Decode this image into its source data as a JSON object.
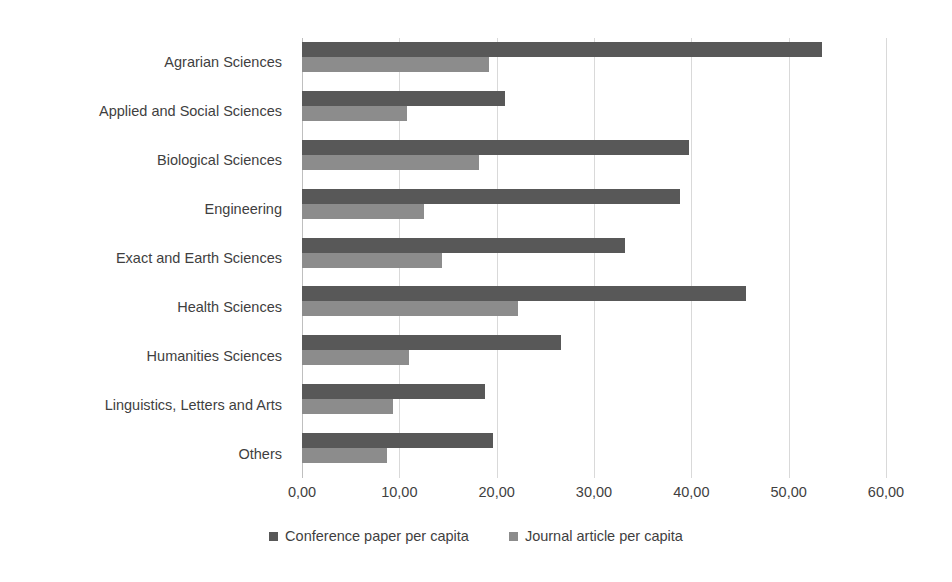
{
  "chart_data": {
    "type": "bar",
    "orientation": "horizontal",
    "title": "",
    "subtitle": "",
    "xlabel": "",
    "ylabel": "",
    "xlim": [
      0,
      60
    ],
    "xticks": [
      0,
      10,
      20,
      30,
      40,
      50,
      60
    ],
    "xtick_labels": [
      "0,00",
      "10,00",
      "20,00",
      "30,00",
      "40,00",
      "50,00",
      "60,00"
    ],
    "grid": "vertical",
    "legend_position": "bottom",
    "categories": [
      "Agrarian Sciences",
      "Applied and Social Sciences",
      "Biological Sciences",
      "Engineering",
      "Exact and Earth Sciences",
      "Health Sciences",
      "Humanities Sciences",
      "Linguistics, Letters and Arts",
      "Others"
    ],
    "series": [
      {
        "name": "Conference paper per capita",
        "color": "#585858",
        "values": [
          53.4,
          20.9,
          39.8,
          38.8,
          33.2,
          45.6,
          26.6,
          18.8,
          19.6
        ]
      },
      {
        "name": "Journal article per capita",
        "color": "#8c8c8c",
        "values": [
          19.2,
          10.8,
          18.2,
          12.5,
          14.4,
          22.2,
          11.0,
          9.4,
          8.7
        ]
      }
    ]
  },
  "style": {
    "gridline_color": "#d9d9d9",
    "axis_color": "#bfbfbf",
    "text_color": "#3f3f3f",
    "background": "#ffffff"
  }
}
